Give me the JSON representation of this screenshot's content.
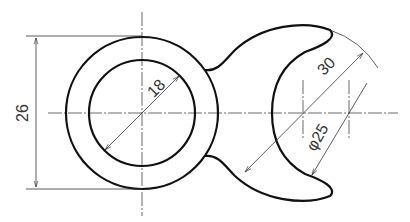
{
  "drawing": {
    "type": "engineering-drawing",
    "dimensions": {
      "overall_height": "26",
      "inner_circle_diameter": "18",
      "outer_arc_radius": "30",
      "crescent_diameter": "φ25"
    }
  }
}
